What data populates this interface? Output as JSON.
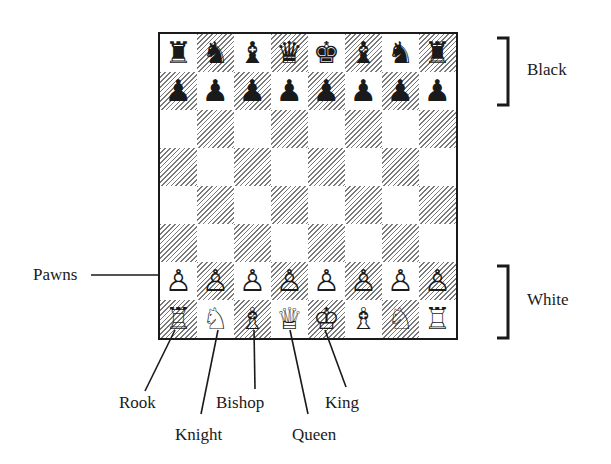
{
  "diagram": {
    "type": "chessboard-starting-position",
    "board": {
      "rows": [
        [
          "♜",
          "♞",
          "♝",
          "♛",
          "♚",
          "♝",
          "♞",
          "♜"
        ],
        [
          "♟",
          "♟",
          "♟",
          "♟",
          "♟",
          "♟",
          "♟",
          "♟"
        ],
        [
          "",
          "",
          "",
          "",
          "",
          "",
          "",
          ""
        ],
        [
          "",
          "",
          "",
          "",
          "",
          "",
          "",
          ""
        ],
        [
          "",
          "",
          "",
          "",
          "",
          "",
          "",
          ""
        ],
        [
          "",
          "",
          "",
          "",
          "",
          "",
          "",
          ""
        ],
        [
          "♙",
          "♙",
          "♙",
          "♙",
          "♙",
          "♙",
          "♙",
          "♙"
        ],
        [
          "♖",
          "♘",
          "♗",
          "♕",
          "♔",
          "♗",
          "♘",
          "♖"
        ]
      ],
      "top_left_square": "light",
      "dark_square_style": "diagonal-hatch"
    },
    "side_labels": {
      "black": "Black",
      "white": "White"
    },
    "callouts": {
      "pawns": "Pawns",
      "rook": "Rook",
      "knight": "Knight",
      "bishop": "Bishop",
      "queen": "Queen",
      "king": "King"
    }
  }
}
